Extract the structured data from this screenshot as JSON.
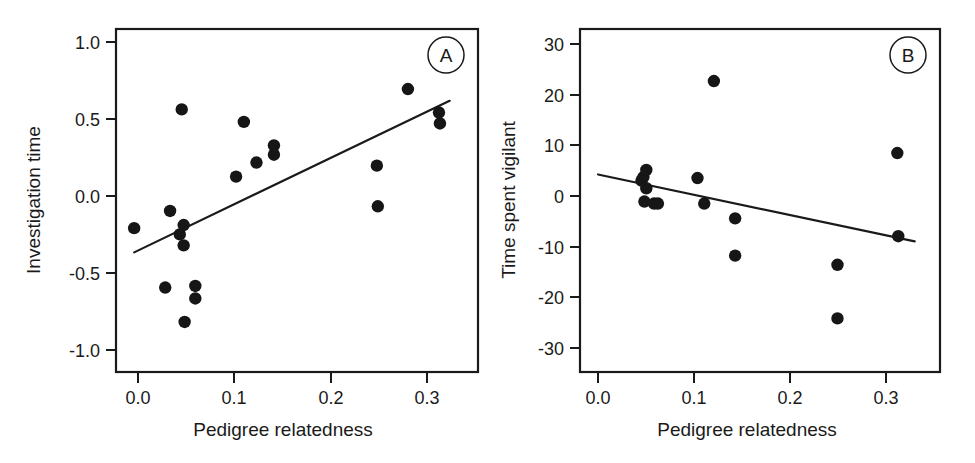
{
  "figure": {
    "width": 975,
    "height": 463,
    "background": "#ffffff",
    "ink_color": "#1a1a1a",
    "point_color": "#161616"
  },
  "chart_data": [
    {
      "type": "scatter",
      "panel_label": "A",
      "title": "",
      "xlabel": "Pedigree relatedness",
      "ylabel": "Investigation time",
      "xlim": [
        -0.0187,
        0.3542
      ],
      "ylim": [
        -1.1104,
        1.0844
      ],
      "xticks": [
        0.0,
        0.1,
        0.2,
        0.3
      ],
      "xticklabels": [
        "0.0",
        "0.1",
        "0.2",
        "0.3"
      ],
      "yticks": [
        1.0,
        0.5,
        0.0,
        -0.5,
        -1.0
      ],
      "yticklabels": [
        "1.0",
        "0.5",
        "0.0",
        "-0.5",
        "-1.0"
      ],
      "grid": false,
      "legend": false,
      "x": [
        0.0,
        0.032,
        0.037,
        0.047,
        0.049,
        0.051,
        0.051,
        0.052,
        0.063,
        0.063,
        0.105,
        0.113,
        0.126,
        0.144,
        0.144,
        0.25,
        0.251,
        0.282,
        0.314,
        0.315
      ],
      "y": [
        -0.19,
        -0.57,
        -0.08,
        -0.23,
        0.57,
        -0.17,
        -0.3,
        -0.79,
        -0.56,
        -0.64,
        0.14,
        0.49,
        0.23,
        0.34,
        0.28,
        0.21,
        -0.05,
        0.7,
        0.55,
        0.48
      ],
      "trendline": {
        "x0": 0.0,
        "y0": -0.345,
        "x1": 0.325,
        "y1": 0.625
      }
    },
    {
      "type": "scatter",
      "panel_label": "B",
      "title": "",
      "xlabel": "Pedigree relatedness",
      "ylabel": "Time spent vigilant",
      "xlim": [
        -0.0187,
        0.3542
      ],
      "ylim": [
        -33.0,
        34.2
      ],
      "xticks": [
        0.0,
        0.1,
        0.2,
        0.3
      ],
      "xticklabels": [
        "0.0",
        "0.1",
        "0.2",
        "0.3"
      ],
      "yticks": [
        30,
        20,
        10,
        0,
        -10,
        -20,
        -30
      ],
      "yticklabels": [
        "30",
        "20",
        "10",
        "0",
        "-10",
        "-20",
        "-30"
      ],
      "grid": false,
      "legend": false,
      "x": [
        0.045,
        0.047,
        0.05,
        0.05,
        0.048,
        0.058,
        0.062,
        0.103,
        0.11,
        0.12,
        0.142,
        0.142,
        0.248,
        0.248,
        0.31,
        0.311
      ],
      "y": [
        4.5,
        5.2,
        6.6,
        3.0,
        0.4,
        0.0,
        0.0,
        5.0,
        0.0,
        24.0,
        -2.9,
        -10.2,
        -12.0,
        -22.5,
        9.9,
        -6.4
      ],
      "trendline": {
        "x0": 0.0,
        "y0": 5.7,
        "x1": 0.328,
        "y1": -7.4
      }
    }
  ]
}
